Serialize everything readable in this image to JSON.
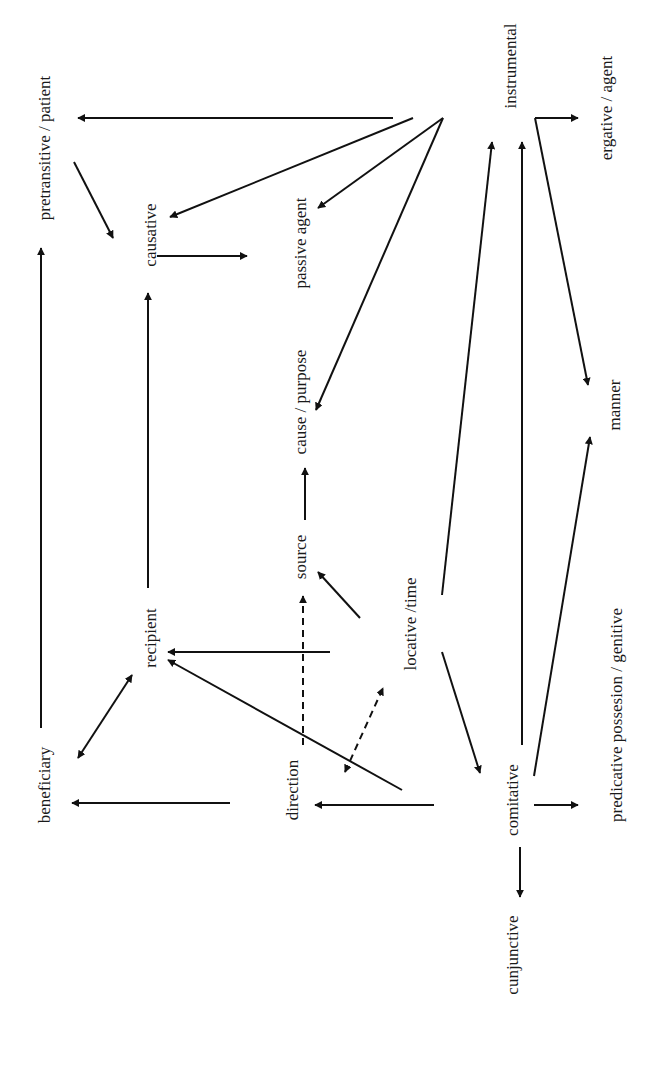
{
  "diagram": {
    "orientation": "rotated -90deg (text reads bottom-to-top)",
    "nodes": [
      {
        "id": "pretransitive",
        "label": "pretransitive / patient",
        "x": 44,
        "y": 148
      },
      {
        "id": "causative",
        "label": "causative",
        "x": 150,
        "y": 235
      },
      {
        "id": "passive_agent",
        "label": "passive agent",
        "x": 300,
        "y": 243
      },
      {
        "id": "cause_purpose",
        "label": "cause / purpose",
        "x": 300,
        "y": 402
      },
      {
        "id": "source",
        "label": "source",
        "x": 300,
        "y": 557
      },
      {
        "id": "recipient",
        "label": "recipient",
        "x": 150,
        "y": 638
      },
      {
        "id": "beneficiary",
        "label": "beneficiary",
        "x": 44,
        "y": 785
      },
      {
        "id": "direction",
        "label": "direction",
        "x": 292,
        "y": 790
      },
      {
        "id": "locative_time",
        "label": "locative /time",
        "x": 410,
        "y": 624
      },
      {
        "id": "comitative",
        "label": "comitative",
        "x": 512,
        "y": 800
      },
      {
        "id": "cunjunctive",
        "label": "cunjunctive",
        "x": 512,
        "y": 955
      },
      {
        "id": "predicative",
        "label": "predicative possesion / genitive",
        "x": 616,
        "y": 715
      },
      {
        "id": "manner",
        "label": "manner",
        "x": 614,
        "y": 405
      },
      {
        "id": "instrumental",
        "label": "instrumental",
        "x": 510,
        "y": 66
      },
      {
        "id": "ergative",
        "label": "ergative / agent",
        "x": 606,
        "y": 108
      }
    ],
    "edges": [
      {
        "from": "instrumental",
        "to": "pretransitive",
        "style": "solid",
        "points": [
          [
            393,
            118
          ],
          [
            78,
            118
          ]
        ],
        "head": "end"
      },
      {
        "from": "instrumental",
        "to": "causative",
        "style": "solid",
        "points": [
          [
            413,
            118
          ],
          [
            170,
            217
          ]
        ],
        "head": "end"
      },
      {
        "from": "instrumental",
        "to": "passive_agent",
        "style": "solid",
        "points": [
          [
            443,
            118
          ],
          [
            318,
            208
          ]
        ],
        "head": "end"
      },
      {
        "from": "instrumental",
        "to": "cause_purpose",
        "style": "solid",
        "points": [
          [
            443,
            118
          ],
          [
            316,
            410
          ]
        ],
        "head": "end"
      },
      {
        "from": "pretransitive",
        "to": "causative",
        "style": "solid",
        "points": [
          [
            74,
            162
          ],
          [
            113,
            238
          ]
        ],
        "head": "end"
      },
      {
        "from": "causative",
        "to": "passive_agent",
        "style": "solid",
        "points": [
          [
            157,
            256
          ],
          [
            247,
            256
          ]
        ],
        "head": "end"
      },
      {
        "from": "recipient",
        "to": "causative",
        "style": "solid",
        "points": [
          [
            148,
            588
          ],
          [
            148,
            293
          ]
        ],
        "head": "end"
      },
      {
        "from": "beneficiary",
        "to": "pretransitive",
        "style": "solid",
        "points": [
          [
            41,
            728
          ],
          [
            41,
            248
          ]
        ],
        "head": "end"
      },
      {
        "from": "source",
        "to": "cause_purpose",
        "style": "solid",
        "points": [
          [
            305,
            520
          ],
          [
            305,
            468
          ]
        ],
        "head": "end"
      },
      {
        "from": "locative_time",
        "to": "source",
        "style": "solid",
        "points": [
          [
            360,
            618
          ],
          [
            318,
            572
          ]
        ],
        "head": "end"
      },
      {
        "from": "direction",
        "to": "source",
        "style": "dashed",
        "points": [
          [
            303,
            745
          ],
          [
            303,
            596
          ]
        ],
        "head": "end"
      },
      {
        "from": "locative_time",
        "to": "recipient",
        "style": "solid",
        "points": [
          [
            330,
            652
          ],
          [
            168,
            652
          ]
        ],
        "head": "end"
      },
      {
        "from": "direction",
        "to": "recipient",
        "style": "solid",
        "points": [
          [
            402,
            790
          ],
          [
            168,
            660
          ]
        ],
        "head": "end"
      },
      {
        "from": "beneficiary",
        "to": "recipient",
        "style": "solid",
        "points": [
          [
            78,
            758
          ],
          [
            132,
            675
          ]
        ],
        "head": "both"
      },
      {
        "from": "direction",
        "to": "locative_time",
        "style": "dashed",
        "points": [
          [
            345,
            772
          ],
          [
            383,
            688
          ]
        ],
        "head": "both"
      },
      {
        "from": "recipient",
        "to": "beneficiary",
        "style": "solid",
        "points": [
          [
            230,
            803
          ],
          [
            72,
            803
          ]
        ],
        "head": "end"
      },
      {
        "from": "comitative",
        "to": "direction",
        "style": "solid",
        "points": [
          [
            434,
            805
          ],
          [
            315,
            805
          ]
        ],
        "head": "end"
      },
      {
        "from": "locative_time",
        "to": "comitative",
        "style": "solid",
        "points": [
          [
            442,
            652
          ],
          [
            480,
            773
          ]
        ],
        "head": "end"
      },
      {
        "from": "locative_time",
        "to": "instrumental",
        "style": "solid",
        "points": [
          [
            442,
            595
          ],
          [
            492,
            142
          ]
        ],
        "head": "end"
      },
      {
        "from": "comitative",
        "to": "instrumental",
        "style": "solid",
        "points": [
          [
            522,
            745
          ],
          [
            522,
            142
          ]
        ],
        "head": "end"
      },
      {
        "from": "comitative",
        "to": "manner",
        "style": "solid",
        "points": [
          [
            534,
            776
          ],
          [
            590,
            437
          ]
        ],
        "head": "end"
      },
      {
        "from": "comitative",
        "to": "cunjunctive",
        "style": "solid",
        "points": [
          [
            520,
            847
          ],
          [
            520,
            897
          ]
        ],
        "head": "end"
      },
      {
        "from": "comitative",
        "to": "predicative",
        "style": "solid",
        "points": [
          [
            534,
            805
          ],
          [
            578,
            805
          ]
        ],
        "head": "end"
      },
      {
        "from": "instrumental",
        "to": "ergative",
        "style": "solid",
        "points": [
          [
            535,
            118
          ],
          [
            535,
            118
          ],
          [
            578,
            118
          ]
        ],
        "head": "end"
      },
      {
        "from": "instrumental",
        "to": "manner",
        "style": "solid",
        "points": [
          [
            535,
            118
          ],
          [
            588,
            385
          ]
        ],
        "head": "end"
      }
    ]
  },
  "colors": {
    "background": "#ffffff",
    "ink": "#111111"
  }
}
